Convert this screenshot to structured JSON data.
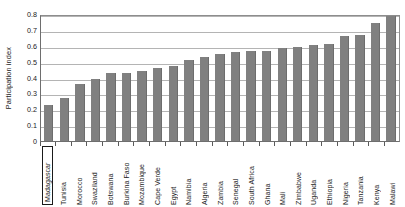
{
  "chart_data": {
    "type": "bar",
    "title": "",
    "xlabel": "",
    "ylabel": "Participation index",
    "ylim": [
      0,
      0.8
    ],
    "ytick_labels": [
      "0.8",
      "0.7",
      "0.6",
      "0.5",
      "0.4",
      "0.3",
      "0.2",
      "0.1",
      "0"
    ],
    "ytick_values": [
      0.8,
      0.7,
      0.6,
      0.5,
      0.4,
      0.3,
      0.2,
      0.1,
      0
    ],
    "grid": true,
    "legend": "none",
    "bar_color": "#808080",
    "highlighted_category": "Madagascar",
    "categories": [
      "Madagascar",
      "Tunisia",
      "Morocco",
      "Swaziland",
      "Botswana",
      "Burkina Faso",
      "Mozambique",
      "Cape Verde",
      "Egypt",
      "Namibia",
      "Algeria",
      "Zambia",
      "Senegal",
      "South Africa",
      "Ghana",
      "Mali",
      "Zimbabwe",
      "Uganda",
      "Ethiopia",
      "Nigeria",
      "Tanzania",
      "Kenya",
      "Malawi"
    ],
    "values": [
      0.23,
      0.27,
      0.36,
      0.39,
      0.43,
      0.43,
      0.44,
      0.46,
      0.47,
      0.51,
      0.53,
      0.55,
      0.56,
      0.565,
      0.57,
      0.585,
      0.59,
      0.605,
      0.61,
      0.66,
      0.67,
      0.745,
      0.795
    ]
  }
}
